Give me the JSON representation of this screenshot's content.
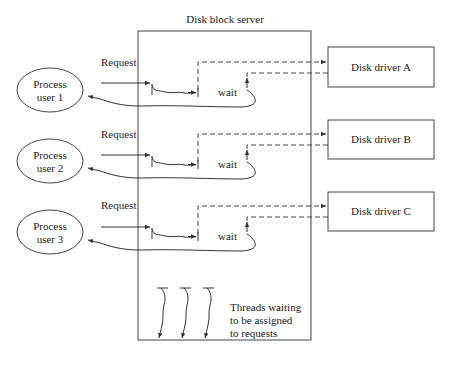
{
  "diagram": {
    "server": {
      "title": "Disk block server"
    },
    "processes": [
      {
        "line1": "Process",
        "line2": "user 1",
        "request_label": "Request",
        "wait_label": "wait"
      },
      {
        "line1": "Process",
        "line2": "user 2",
        "request_label": "Request",
        "wait_label": "wait"
      },
      {
        "line1": "Process",
        "line2": "user 3",
        "request_label": "Request",
        "wait_label": "wait"
      }
    ],
    "drivers": [
      {
        "label": "Disk driver A"
      },
      {
        "label": "Disk driver B"
      },
      {
        "label": "Disk driver C"
      }
    ],
    "thread_pool": {
      "count": 3,
      "caption_lines": [
        "Threads waiting",
        "to be assigned",
        "to requests"
      ]
    },
    "colors": {
      "stroke": "#333333",
      "text": "#222222",
      "background": "#ffffff"
    }
  }
}
